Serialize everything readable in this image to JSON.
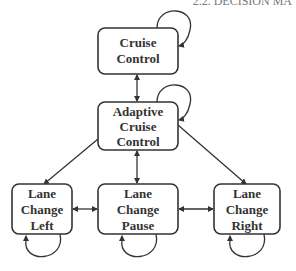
{
  "header_fragment": "2.2. DECISION MA",
  "nodes": [
    {
      "id": "cc",
      "lines": [
        "Cruise",
        "Control"
      ]
    },
    {
      "id": "acc",
      "lines": [
        "Adaptive",
        "Cruise",
        "Control"
      ]
    },
    {
      "id": "lcl",
      "lines": [
        "Lane",
        "Change",
        "Left"
      ]
    },
    {
      "id": "lcp",
      "lines": [
        "Lane",
        "Change",
        "Pause"
      ]
    },
    {
      "id": "lcr",
      "lines": [
        "Lane",
        "Change",
        "Right"
      ]
    }
  ],
  "edges": [
    {
      "from": "cc",
      "to": "cc",
      "type": "self-loop"
    },
    {
      "from": "acc",
      "to": "acc",
      "type": "self-loop"
    },
    {
      "from": "lcl",
      "to": "lcl",
      "type": "self-loop"
    },
    {
      "from": "lcp",
      "to": "lcp",
      "type": "self-loop"
    },
    {
      "from": "lcr",
      "to": "lcr",
      "type": "self-loop"
    },
    {
      "from": "cc",
      "to": "acc",
      "type": "bidirectional"
    },
    {
      "from": "acc",
      "to": "lcp",
      "type": "bidirectional"
    },
    {
      "from": "acc",
      "to": "lcl",
      "type": "directed"
    },
    {
      "from": "acc",
      "to": "lcr",
      "type": "directed"
    },
    {
      "from": "lcl",
      "to": "lcp",
      "type": "bidirectional"
    },
    {
      "from": "lcp",
      "to": "lcr",
      "type": "bidirectional"
    }
  ]
}
